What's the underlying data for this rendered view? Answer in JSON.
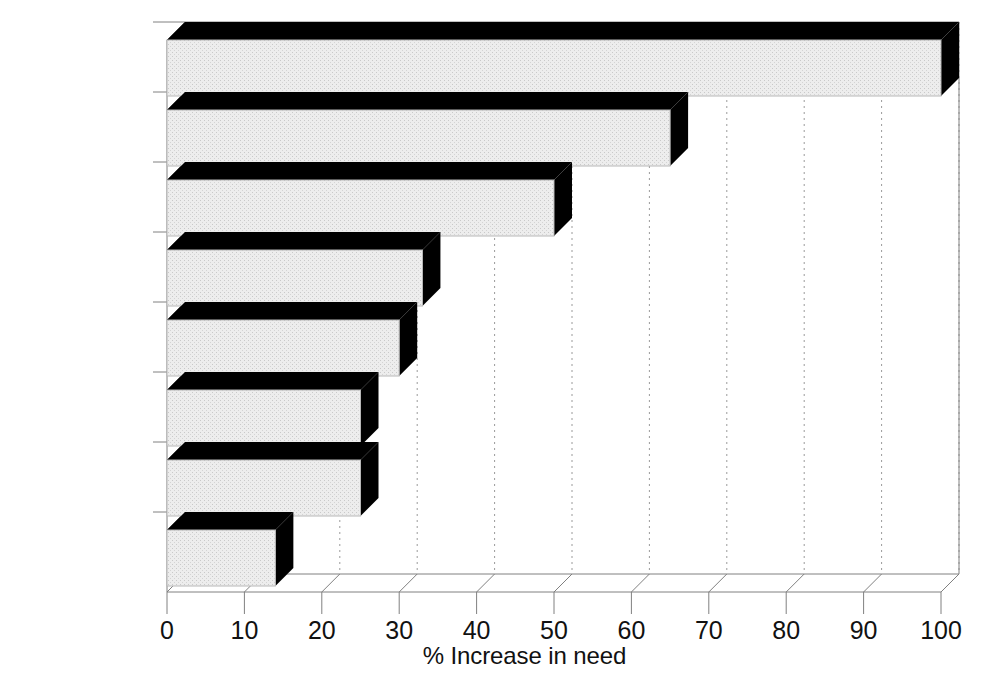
{
  "chart_data": {
    "type": "bar",
    "orientation": "horizontal",
    "title": "",
    "subtitle": "",
    "xlabel": "% Increase in need",
    "ylabel": "",
    "categories": [
      "Folacin",
      "Protein",
      "Calcium",
      "Vitamin C",
      "Thiamin",
      "Vitamin A",
      "Riboflavin",
      "Energy"
    ],
    "values": [
      100,
      65,
      50,
      33,
      30,
      25,
      25,
      14
    ],
    "xlim": [
      0,
      100
    ],
    "xticks": [
      0,
      10,
      20,
      30,
      40,
      50,
      60,
      70,
      80,
      90,
      100
    ],
    "xticklabels": [
      "0",
      "10",
      "20",
      "30",
      "40",
      "50",
      "60",
      "70",
      "80",
      "90",
      "100"
    ],
    "grid": "vertical-dotted",
    "legend": "none",
    "bar_style": "3d-block",
    "annotations": []
  },
  "style": {
    "bar_face_color": "#e9e9e9",
    "bar_shadow_color": "#000000",
    "bar_edge_color": "#000000",
    "grid_color": "#9a9a9a",
    "axis_color": "#808080",
    "background_color": "#ffffff",
    "text_color": "#111111"
  },
  "geometry": {
    "plot_left": 167,
    "plot_right": 941,
    "baseline_y": 592,
    "depth_x": 18,
    "depth_y": 18,
    "bar_height": 56,
    "slot_height": 70,
    "first_slot_top": 40
  }
}
